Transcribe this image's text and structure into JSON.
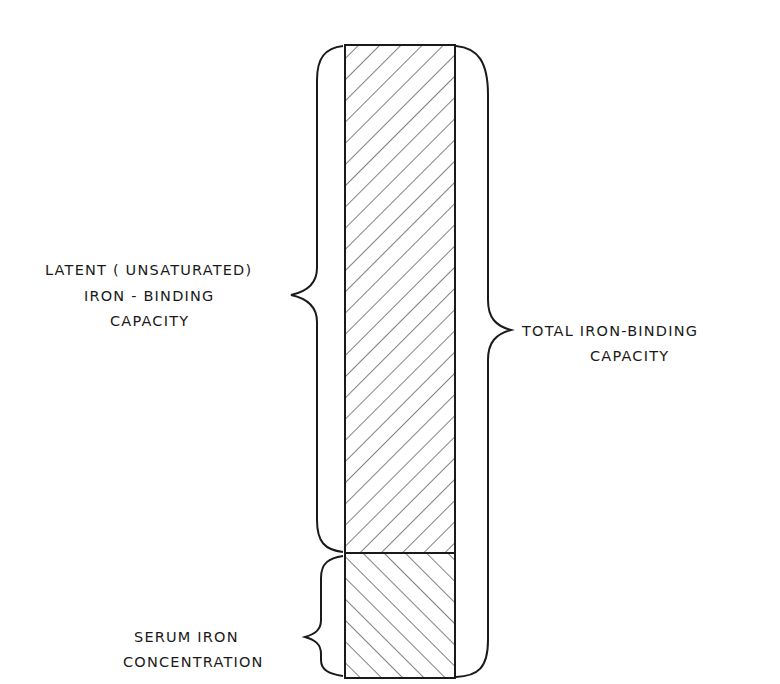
{
  "diagram": {
    "type": "stacked-bar-with-braces",
    "bar": {
      "segments": [
        {
          "id": "latent",
          "label_lines": [
            "LATENT (UNSATURATED)",
            "IRON - BINDING",
            "CAPACITY"
          ],
          "hatch": "forward-diagonal",
          "position": "top"
        },
        {
          "id": "serum",
          "label_lines": [
            "SERUM IRON",
            "CONCENTRATION"
          ],
          "hatch": "backward-diagonal",
          "position": "bottom"
        }
      ]
    },
    "labels": {
      "latent": {
        "line1_prefix": "LATENT ( ",
        "line1_small": "UNSATURATED",
        "line1_suffix": ")",
        "line2": "IRON - BINDING",
        "line3": "CAPACITY"
      },
      "serum": {
        "line1": "SERUM IRON",
        "line2": "CONCENTRATION"
      },
      "total": {
        "line1": "TOTAL IRON-BINDING",
        "line2": "CAPACITY"
      }
    },
    "colors": {
      "stroke": "#1a1a1a",
      "background": "#ffffff"
    }
  }
}
